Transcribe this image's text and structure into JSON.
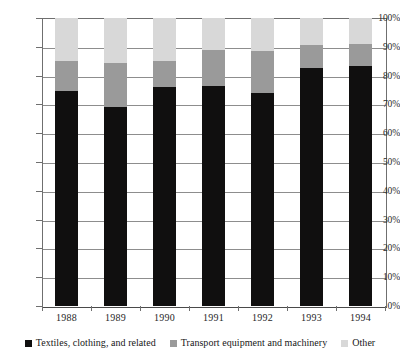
{
  "chart_data": {
    "type": "bar",
    "subtype": "stacked-bar-100-percent",
    "title": "",
    "subtitle": "",
    "xlabel": "",
    "ylabel": "",
    "categories": [
      "1988",
      "1989",
      "1990",
      "1991",
      "1992",
      "1993",
      "1994"
    ],
    "series": [
      {
        "name": "Textiles, clothing, and related",
        "color": "#100f0f",
        "values": [
          74.5,
          69.0,
          76.0,
          76.5,
          74.0,
          82.5,
          83.3
        ]
      },
      {
        "name": "Transport equipment and machinery",
        "color": "#9a9a9a",
        "values": [
          10.5,
          15.5,
          9.0,
          12.3,
          14.5,
          8.0,
          7.7
        ]
      },
      {
        "name": "Other",
        "color": "#d8d8d8",
        "values": [
          15.0,
          15.5,
          15.0,
          11.2,
          11.5,
          9.5,
          9.0
        ]
      }
    ],
    "ylim": [
      0,
      100
    ],
    "ytick_values": [
      0,
      10,
      20,
      30,
      40,
      50,
      60,
      70,
      80,
      90,
      100
    ],
    "ytick_labels": [
      "0%",
      "10%",
      "20%",
      "30%",
      "40%",
      "50%",
      "60%",
      "70%",
      "80%",
      "90%",
      "100%"
    ],
    "grid": true,
    "grid_axis": "y",
    "legend_position": "bottom",
    "legend_entries": [
      "Textiles, clothing, and related",
      "Transport equipment and machinery",
      "Other"
    ]
  },
  "colors": {
    "textiles": "#100f0f",
    "transport": "#9a9a9a",
    "other": "#d8d8d8",
    "gridline": "#8d8d8d",
    "axis": "#6f6f6f",
    "background": "#ffffff"
  }
}
